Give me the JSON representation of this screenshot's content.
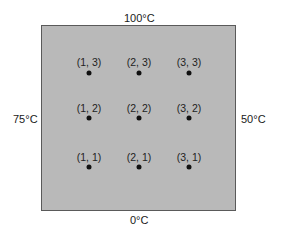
{
  "figure": {
    "plate_color": "#b9b9b9",
    "boundaries": {
      "top": "100°C",
      "bottom": "0°C",
      "left": "75°C",
      "right": "50°C"
    },
    "nodes": [
      {
        "label": "(1, 3)",
        "col": 1,
        "row": 3
      },
      {
        "label": "(2, 3)",
        "col": 2,
        "row": 3
      },
      {
        "label": "(3, 3)",
        "col": 3,
        "row": 3
      },
      {
        "label": "(1, 2)",
        "col": 1,
        "row": 2
      },
      {
        "label": "(2, 2)",
        "col": 2,
        "row": 2
      },
      {
        "label": "(3, 2)",
        "col": 3,
        "row": 2
      },
      {
        "label": "(1, 1)",
        "col": 1,
        "row": 1
      },
      {
        "label": "(2, 1)",
        "col": 2,
        "row": 1
      },
      {
        "label": "(3, 1)",
        "col": 3,
        "row": 1
      }
    ]
  }
}
